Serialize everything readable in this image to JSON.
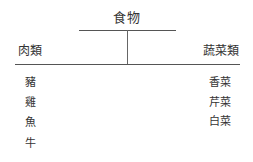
{
  "diagram": {
    "root": {
      "label": "食物"
    },
    "categories": [
      {
        "label": "肉類",
        "items": [
          "豬",
          "雞",
          "魚",
          "牛"
        ]
      },
      {
        "label": "蔬菜類",
        "items": [
          "香菜",
          "芹菜",
          "白菜"
        ]
      }
    ],
    "colors": {
      "text": "#333333",
      "line": "#555555",
      "background": "#ffffff"
    }
  }
}
